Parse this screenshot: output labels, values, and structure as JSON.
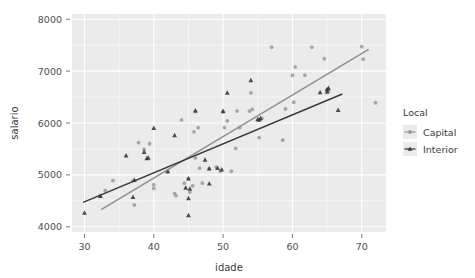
{
  "chart_data": {
    "type": "scatter",
    "title": "",
    "xlabel": "idade",
    "ylabel": "salario",
    "xlim": [
      28.2,
      73.5
    ],
    "ylim": [
      3900,
      8100
    ],
    "xticks": [
      30,
      40,
      50,
      60,
      70
    ],
    "yticks": [
      4000,
      5000,
      6000,
      7000,
      8000
    ],
    "xtick_labels": [
      "30",
      "40",
      "50",
      "60",
      "70"
    ],
    "ytick_labels": [
      "4000",
      "5000",
      "6000",
      "7000",
      "8000"
    ],
    "grid": true,
    "grid_color": "#ffffff",
    "panel_background": "#ebebeb",
    "legend": {
      "title": "Local",
      "position": "right",
      "entries": [
        {
          "label": "Capital",
          "color": "#9a9a9a",
          "marker": "circle"
        },
        {
          "label": "Interior",
          "color": "#3a3a3a",
          "marker": "triangle"
        }
      ]
    },
    "series": [
      {
        "name": "Capital",
        "color": "#9a9a9a",
        "marker": "circle",
        "points": [
          [
            32.2,
            4590
          ],
          [
            34.1,
            4890
          ],
          [
            33.0,
            4700
          ],
          [
            37.2,
            4420
          ],
          [
            37.0,
            4890
          ],
          [
            38.6,
            5490
          ],
          [
            37.8,
            5620
          ],
          [
            39.4,
            5600
          ],
          [
            40.0,
            4810
          ],
          [
            40.0,
            4740
          ],
          [
            42.0,
            5060
          ],
          [
            43.0,
            4640
          ],
          [
            43.2,
            4600
          ],
          [
            44.4,
            4840
          ],
          [
            45.0,
            4930
          ],
          [
            45.2,
            4670
          ],
          [
            45.6,
            4790
          ],
          [
            45.8,
            5830
          ],
          [
            44.0,
            6060
          ],
          [
            46.0,
            5330
          ],
          [
            46.6,
            5130
          ],
          [
            46.4,
            5910
          ],
          [
            46.0,
            6220
          ],
          [
            47.0,
            4840
          ],
          [
            48.0,
            5120
          ],
          [
            49.0,
            5150
          ],
          [
            49.6,
            5070
          ],
          [
            50.2,
            5910
          ],
          [
            50.6,
            6040
          ],
          [
            50.0,
            6210
          ],
          [
            51.2,
            5070
          ],
          [
            51.8,
            5510
          ],
          [
            52.4,
            5910
          ],
          [
            52.0,
            6230
          ],
          [
            53.8,
            6230
          ],
          [
            54.2,
            6260
          ],
          [
            54.0,
            6580
          ],
          [
            55.2,
            5720
          ],
          [
            55.6,
            6090
          ],
          [
            57.0,
            7460
          ],
          [
            58.6,
            5670
          ],
          [
            59.0,
            6270
          ],
          [
            60.2,
            6400
          ],
          [
            60.0,
            6920
          ],
          [
            60.4,
            7080
          ],
          [
            61.8,
            6920
          ],
          [
            62.8,
            7460
          ],
          [
            64.6,
            7240
          ],
          [
            65.0,
            6640
          ],
          [
            65.2,
            6610
          ],
          [
            70.0,
            7470
          ],
          [
            70.2,
            7230
          ],
          [
            72.0,
            6390
          ]
        ]
      },
      {
        "name": "Interior",
        "color": "#3a3a3a",
        "marker": "triangle",
        "points": [
          [
            30.0,
            4270
          ],
          [
            32.3,
            4590
          ],
          [
            36.0,
            5370
          ],
          [
            37.0,
            4570
          ],
          [
            37.2,
            4900
          ],
          [
            38.6,
            5440
          ],
          [
            39.0,
            5320
          ],
          [
            39.2,
            5330
          ],
          [
            40.0,
            5900
          ],
          [
            42.0,
            5070
          ],
          [
            43.0,
            5760
          ],
          [
            44.6,
            4750
          ],
          [
            45.0,
            4930
          ],
          [
            45.0,
            4550
          ],
          [
            45.0,
            4220
          ],
          [
            45.2,
            4730
          ],
          [
            46.0,
            6240
          ],
          [
            47.4,
            5290
          ],
          [
            48.0,
            4830
          ],
          [
            48.0,
            5120
          ],
          [
            49.2,
            5130
          ],
          [
            49.8,
            5100
          ],
          [
            50.0,
            6230
          ],
          [
            50.6,
            6580
          ],
          [
            54.0,
            6820
          ],
          [
            55.0,
            6070
          ],
          [
            55.2,
            6060
          ],
          [
            55.4,
            6090
          ],
          [
            64.0,
            6590
          ],
          [
            65.0,
            6650
          ],
          [
            65.2,
            6670
          ],
          [
            65.0,
            6600
          ],
          [
            66.6,
            6250
          ]
        ]
      }
    ],
    "trend_lines": [
      {
        "name": "Capital",
        "color": "#8f8f8f",
        "x_start": 32.4,
        "y_start": 4330,
        "x_end": 71.0,
        "y_end": 7420
      },
      {
        "name": "Interior",
        "color": "#3a3a3a",
        "x_start": 29.8,
        "y_start": 4470,
        "x_end": 67.2,
        "y_end": 6560
      }
    ]
  }
}
